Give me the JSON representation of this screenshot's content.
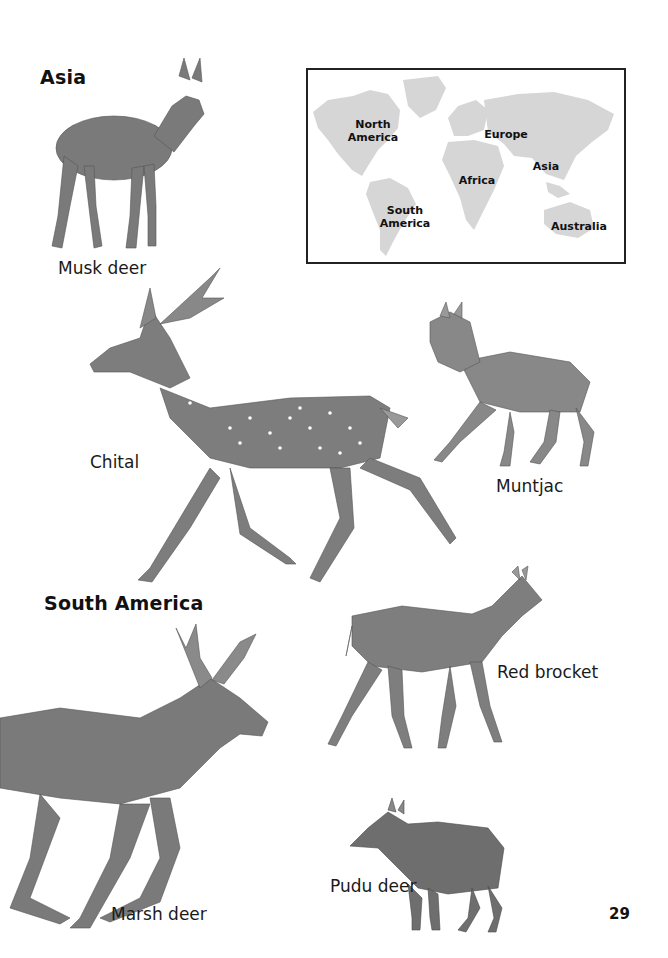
{
  "page": {
    "number": "29"
  },
  "sections": [
    {
      "heading": "Asia"
    },
    {
      "heading": "South America"
    }
  ],
  "map": {
    "labels": {
      "north_america": "North America",
      "south_america": "South America",
      "europe": "Europe",
      "africa": "Africa",
      "asia": "Asia",
      "australia": "Australia"
    },
    "land_color": "#d6d6d6",
    "border_color": "#222222"
  },
  "animals": [
    {
      "name": "Musk deer",
      "region": "Asia"
    },
    {
      "name": "Chital",
      "region": "Asia"
    },
    {
      "name": "Muntjac",
      "region": "Asia"
    },
    {
      "name": "Red brocket",
      "region": "South America"
    },
    {
      "name": "Marsh deer",
      "region": "South America"
    },
    {
      "name": "Pudu deer",
      "region": "South America"
    }
  ]
}
